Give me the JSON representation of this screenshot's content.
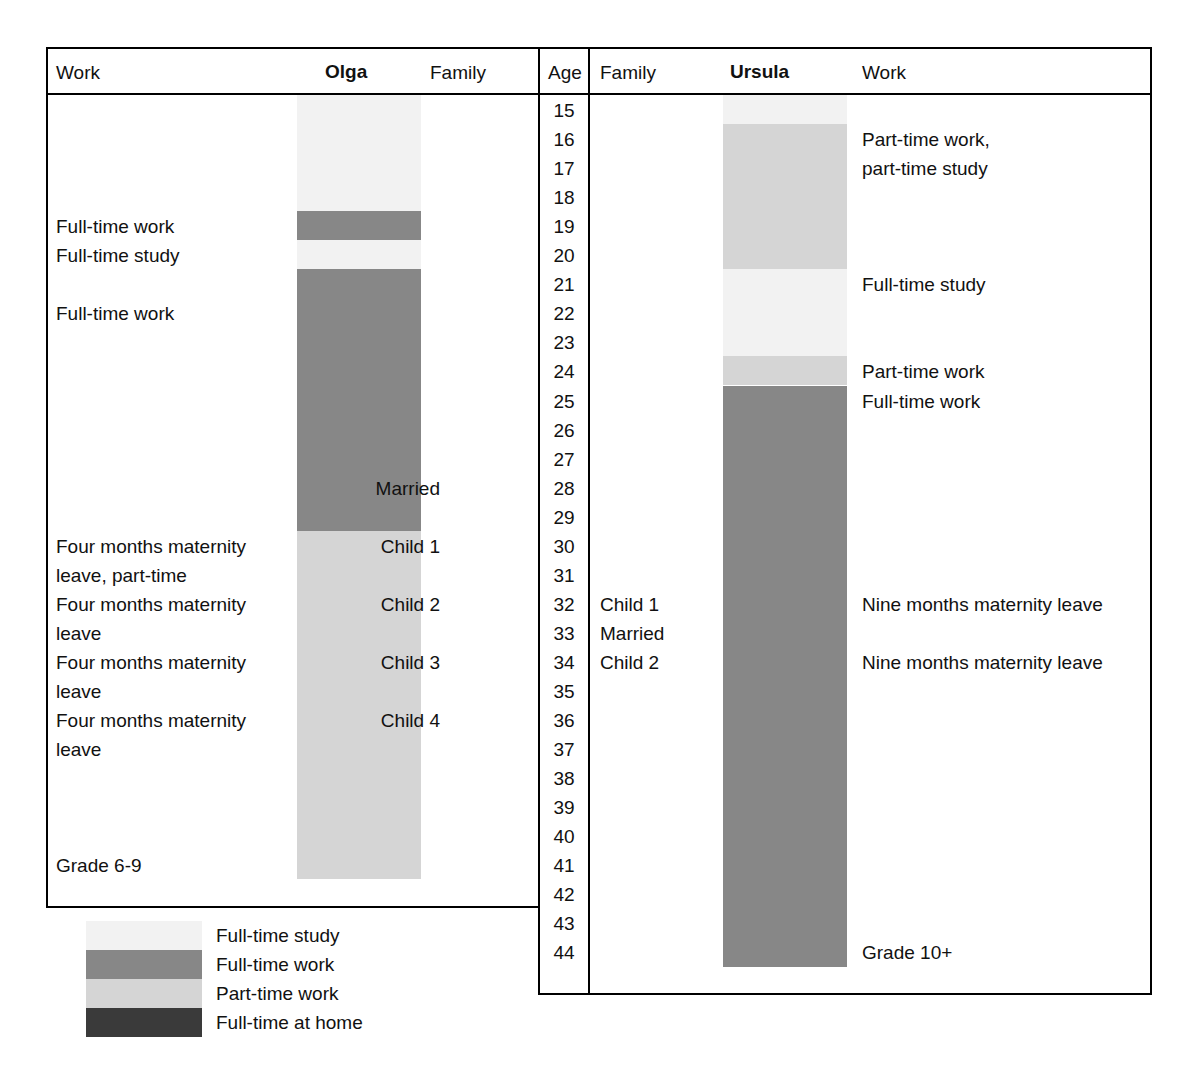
{
  "figure": {
    "type": "life-course-timeline-table",
    "persons": [
      "Olga",
      "Ursula"
    ],
    "age_axis_label": "Age",
    "age_min": 15,
    "age_max": 44
  },
  "colors": {
    "full_time_study": "#f2f2f2",
    "full_time_work": "#878787",
    "part_time_work": "#d5d5d5",
    "full_time_at_home": "#3a3a3a",
    "rule": "#000000",
    "text": "#111111",
    "background": "#ffffff"
  },
  "olga": {
    "headers": {
      "work": "Work",
      "name": "Olga",
      "family": "Family"
    },
    "work_labels": [
      {
        "text": "Full-time work",
        "age": 19
      },
      {
        "text": "Full-time study",
        "age": 20
      },
      {
        "text": "Full-time work",
        "age": 22
      },
      {
        "text": "Four months maternity",
        "age": 30
      },
      {
        "text": "leave, part-time",
        "age": 31
      },
      {
        "text": "Four months maternity",
        "age": 32
      },
      {
        "text": "leave",
        "age": 33
      },
      {
        "text": "Four months maternity",
        "age": 34
      },
      {
        "text": "leave",
        "age": 35
      },
      {
        "text": "Four months maternity",
        "age": 36
      },
      {
        "text": "leave",
        "age": 37
      },
      {
        "text": "Grade 6-9",
        "age": 41
      }
    ],
    "family_labels": [
      {
        "text": "Married",
        "age": 28
      },
      {
        "text": "Child 1",
        "age": 30
      },
      {
        "text": "Child 2",
        "age": 32
      },
      {
        "text": "Child 3",
        "age": 34
      },
      {
        "text": "Child 4",
        "age": 36
      }
    ],
    "segments": [
      {
        "state": "Full-time study",
        "from_age": 15,
        "to_age": 19,
        "color_key": "full_time_study"
      },
      {
        "state": "Full-time work",
        "from_age": 19,
        "to_age": 20,
        "color_key": "full_time_work"
      },
      {
        "state": "Full-time study",
        "from_age": 20,
        "to_age": 21,
        "color_key": "full_time_study"
      },
      {
        "state": "Full-time work",
        "from_age": 21,
        "to_age": 30,
        "color_key": "full_time_work"
      },
      {
        "state": "Part-time work",
        "from_age": 30,
        "to_age": 42,
        "color_key": "part_time_work"
      }
    ],
    "last_age": 41
  },
  "ursula": {
    "headers": {
      "family": "Family",
      "name": "Ursula",
      "work": "Work"
    },
    "work_labels": [
      {
        "text": "Part-time work,",
        "age": 16
      },
      {
        "text": "part-time study",
        "age": 17
      },
      {
        "text": "Full-time study",
        "age": 21
      },
      {
        "text": "Part-time work",
        "age": 24
      },
      {
        "text": "Full-time work",
        "age": 25
      },
      {
        "text": "Nine months maternity leave",
        "age": 32
      },
      {
        "text": "Nine months maternity leave",
        "age": 34
      },
      {
        "text": "Grade 10+",
        "age": 44
      }
    ],
    "family_labels": [
      {
        "text": "Child 1",
        "age": 32
      },
      {
        "text": "Married",
        "age": 33
      },
      {
        "text": "Child 2",
        "age": 34
      }
    ],
    "segments": [
      {
        "state": "Full-time study",
        "from_age": 15,
        "to_age": 16,
        "color_key": "full_time_study"
      },
      {
        "state": "Part-time work",
        "from_age": 16,
        "to_age": 21,
        "color_key": "part_time_work"
      },
      {
        "state": "Full-time study",
        "from_age": 21,
        "to_age": 24,
        "color_key": "full_time_study"
      },
      {
        "state": "Part-time work",
        "from_age": 24,
        "to_age": 25,
        "color_key": "part_time_work"
      },
      {
        "state": "Full-time work",
        "from_age": 25,
        "to_age": 45,
        "color_key": "full_time_work"
      }
    ],
    "last_age": 44
  },
  "ages": [
    15,
    16,
    17,
    18,
    19,
    20,
    21,
    22,
    23,
    24,
    25,
    26,
    27,
    28,
    29,
    30,
    31,
    32,
    33,
    34,
    35,
    36,
    37,
    38,
    39,
    40,
    41,
    42,
    43,
    44
  ],
  "legend": [
    {
      "label": "Full-time study",
      "color_key": "full_time_study"
    },
    {
      "label": "Full-time work",
      "color_key": "full_time_work"
    },
    {
      "label": "Part-time work",
      "color_key": "part_time_work"
    },
    {
      "label": "Full-time at home",
      "color_key": "full_time_at_home"
    }
  ]
}
